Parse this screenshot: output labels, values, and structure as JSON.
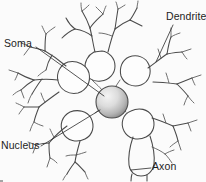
{
  "figure": {
    "background_color": "#fbfbfb",
    "ink_color": "#4a4a4a",
    "width": 206,
    "height": 182
  },
  "labels": {
    "soma": "Soma",
    "dendrite": "Dendrite",
    "nucleus": "Nucleus",
    "axon": "Axon"
  },
  "parts": {
    "nucleus": {
      "name": "nucleus-sphere",
      "shape": "circle",
      "center_x": 112,
      "center_y": 102,
      "radius": 16,
      "fill_light": "#f2f2f2",
      "fill_dark": "#9a9a9a",
      "stroke": "#4a4a4a"
    },
    "soma": {
      "name": "soma-cell-body",
      "description": "central cell body with radiating lobes"
    },
    "axon": {
      "name": "axon-process",
      "description": "long U-shaped process at lower center-right"
    },
    "dendrites": {
      "name": "dendrite-branches",
      "description": "branching processes radiating in all directions"
    }
  },
  "leaders": {
    "soma": {
      "from_x": 36,
      "from_y": 47,
      "to_x": 104,
      "to_y": 96
    },
    "dendrite": {
      "from_x": 173,
      "from_y": 25,
      "to_x": 156,
      "to_y": 62
    },
    "nucleus": {
      "from_x": 41,
      "from_y": 146,
      "to_x": 100,
      "to_y": 110
    },
    "axon": {
      "from_x": 151,
      "from_y": 168,
      "to_x": 131,
      "to_y": 170
    }
  }
}
